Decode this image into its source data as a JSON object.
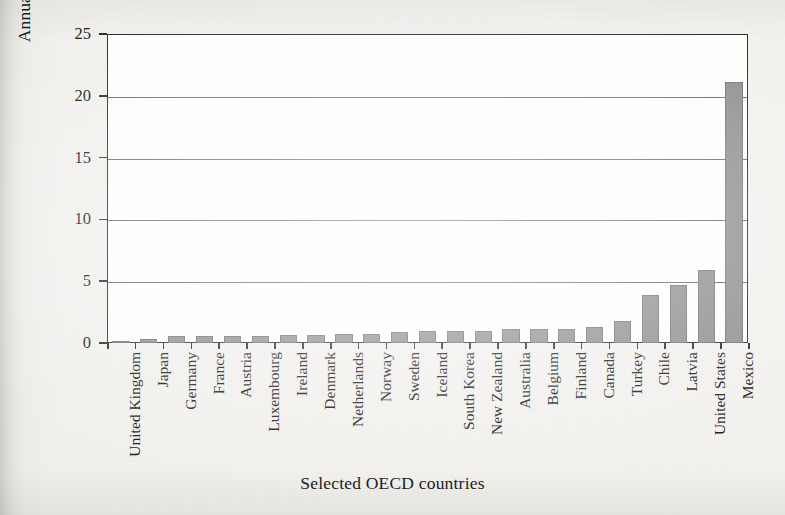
{
  "figure": {
    "background_color": "#f2f1ee",
    "plot_background_color": "#fdfdfc",
    "frame_color": "#232323",
    "bar_color": "#8c8c8c",
    "bar_edge_color": "#6f6f6f",
    "gridline_color": "#4a4a4a"
  },
  "chart_data": {
    "type": "bar",
    "title": "",
    "subtitle": "",
    "xlabel": "Selected OECD countries",
    "ylabel": "Annual homicides per 100,000 people",
    "ylim": [
      0,
      25
    ],
    "yticks": [
      0,
      5,
      10,
      15,
      20,
      25
    ],
    "ytick_labels": [
      "0",
      "5",
      "10",
      "15",
      "20",
      "25"
    ],
    "grid": true,
    "grid_axis": "y",
    "legend": false,
    "legend_position": "none",
    "orientation": "vertical",
    "categories": [
      "United Kingdom",
      "Japan",
      "Germany",
      "France",
      "Austria",
      "Luxembourg",
      "Ireland",
      "Denmark",
      "Netherlands",
      "Norway",
      "Sweden",
      "Iceland",
      "South Korea",
      "New Zealand",
      "Australia",
      "Belgium",
      "Finland",
      "Canada",
      "Turkey",
      "Chile",
      "Latvia",
      "United States",
      "Mexico"
    ],
    "values": [
      0.2,
      0.3,
      0.55,
      0.6,
      0.6,
      0.6,
      0.65,
      0.65,
      0.7,
      0.7,
      0.9,
      0.95,
      0.95,
      1.0,
      1.1,
      1.15,
      1.15,
      1.3,
      1.8,
      3.9,
      4.7,
      5.9,
      21.1
    ]
  }
}
